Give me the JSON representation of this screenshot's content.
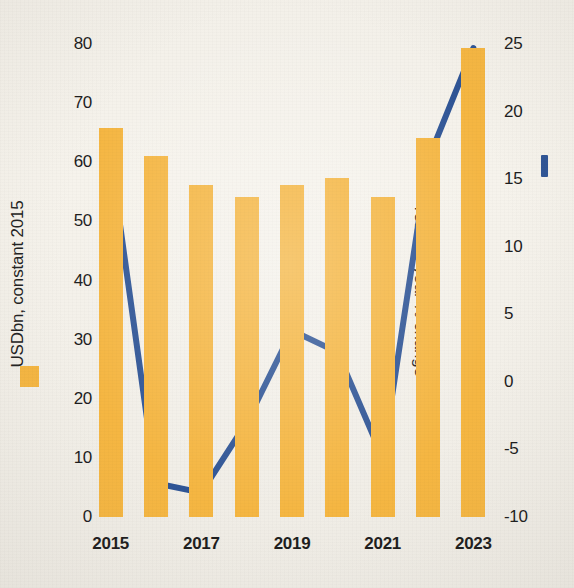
{
  "chart_data": {
    "type": "bar",
    "title": "",
    "subtitle": "",
    "xlabel": "",
    "categories": [
      "2015",
      "2016",
      "2017",
      "2018",
      "2019",
      "2020",
      "2021",
      "2022",
      "2023"
    ],
    "x_tick_labels": [
      "2015",
      "2017",
      "2019",
      "2021",
      "2023"
    ],
    "grid": false,
    "legend_position": "axis-titles",
    "series": [
      {
        "name": "USDbn, constant 2015",
        "type": "bar",
        "axis": "left",
        "color": "#f5b642",
        "values": [
          65.8,
          61.0,
          56.2,
          54.2,
          56.2,
          57.3,
          54.2,
          64.1,
          79.4
        ]
      },
      {
        "name": "Year-on-year % change",
        "type": "line",
        "axis": "right",
        "color": "#2f5596",
        "values": [
          16.6,
          -7.5,
          -8.2,
          -3.0,
          3.8,
          2.2,
          -5.6,
          16.4,
          24.7
        ]
      }
    ],
    "left_axis": {
      "label": "USDbn, constant 2015",
      "ticks": [
        0,
        10,
        20,
        30,
        40,
        50,
        60,
        70,
        80
      ],
      "tick_labels": [
        "0",
        "10",
        "20",
        "30",
        "40",
        "50",
        "60",
        "70",
        "80"
      ],
      "ylim": [
        0,
        80
      ]
    },
    "right_axis": {
      "label": "Year-on-year % change",
      "ticks": [
        -10,
        -5,
        0,
        5,
        10,
        15,
        20,
        25
      ],
      "tick_labels": [
        "-10",
        "-5",
        "0",
        "5",
        "10",
        "15",
        "20",
        "25"
      ],
      "ylim": [
        -10,
        25
      ]
    }
  },
  "colors": {
    "bar": "#f5b642",
    "line": "#2f5596",
    "background": "#f3f0e9",
    "text": "#1d1d1d"
  },
  "legend": {
    "bar_marker": "orange-square",
    "line_marker": "blue-line-segment"
  }
}
